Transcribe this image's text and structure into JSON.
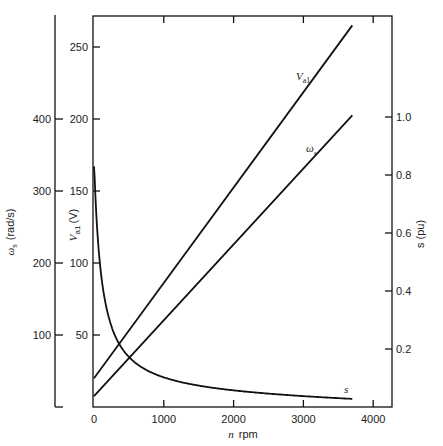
{
  "chart_data": {
    "type": "line",
    "title": "",
    "xlabel": "n rpm",
    "x_ticks": [
      0,
      1000,
      2000,
      3000,
      4000
    ],
    "xlim": [
      0,
      4300
    ],
    "axes": {
      "left_inner": {
        "label": "V_a1 (V)",
        "ticks": [
          50,
          100,
          150,
          200,
          250
        ],
        "range": [
          0,
          270
        ]
      },
      "left_outer": {
        "label": "ω_s (rad/s)",
        "ticks": [
          100,
          200,
          300,
          400
        ],
        "range": [
          0,
          540
        ]
      },
      "right": {
        "label": "s (pu)",
        "ticks": [
          0.2,
          0.4,
          0.6,
          0.8,
          1.0
        ],
        "range": [
          0,
          1.35
        ]
      }
    },
    "grid": false,
    "legend": "inline curve labels",
    "series": [
      {
        "name": "V_a1",
        "axis": "left_inner",
        "x": [
          0,
          3700
        ],
        "values": [
          20,
          265
        ]
      },
      {
        "name": "ω_s",
        "axis": "left_outer",
        "x": [
          0,
          3700
        ],
        "values": [
          15,
          405
        ]
      },
      {
        "name": "s",
        "axis": "right",
        "x": [
          0,
          50,
          100,
          200,
          300,
          500,
          700,
          1000,
          1500,
          2000,
          2500,
          3000,
          3700
        ],
        "values": [
          0.83,
          0.62,
          0.48,
          0.33,
          0.25,
          0.17,
          0.13,
          0.085,
          0.065,
          0.05,
          0.043,
          0.038,
          0.03
        ]
      }
    ]
  },
  "labels": {
    "x_axis_title_var": "n",
    "x_axis_title_unit": "rpm",
    "left_inner_title": "V",
    "left_inner_sub": "a1",
    "left_inner_unit": "(V)",
    "left_outer_title": "ω",
    "left_outer_sub": "s",
    "left_outer_unit": "(rad/s)",
    "right_title": "s (pu)",
    "curve_v": "V",
    "curve_v_sub": "a1",
    "curve_w": "ω",
    "curve_w_sub": "s",
    "curve_s": "s"
  }
}
